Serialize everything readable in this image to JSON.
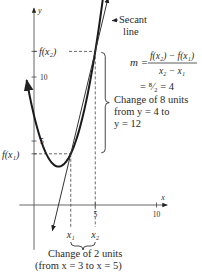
{
  "chart_data": {
    "type": "line",
    "title": "",
    "xlabel": "x",
    "ylabel": "y",
    "xlim": [
      -1.2,
      11.2
    ],
    "ylim": [
      -3.5,
      16.5
    ],
    "x_ticks": [
      {
        "value": 5,
        "label": "5"
      },
      {
        "value": 10,
        "label": "10"
      }
    ],
    "y_ticks": [
      {
        "value": 5,
        "label": "5"
      },
      {
        "value": 10,
        "label": "10"
      }
    ],
    "grid": false,
    "series": [
      {
        "name": "f(x)",
        "kind": "parabola",
        "formula": "x^2 - 4x + 7",
        "a": 1,
        "b": -4,
        "c": 7,
        "x_range": [
          -0.6,
          6.1
        ]
      },
      {
        "name": "Secant line",
        "kind": "line",
        "slope": 4,
        "through": [
          3,
          4
        ],
        "x_range": [
          1.5,
          6.05
        ]
      }
    ],
    "points": [
      {
        "name": "x1",
        "x": 3,
        "y": 4,
        "x_label": "x₁",
        "y_label": "f(x₁)"
      },
      {
        "name": "x2",
        "x": 5,
        "y": 12,
        "x_label": "x₂",
        "y_label": "f(x₂)"
      }
    ],
    "annotations": {
      "secant_label": [
        "Secant",
        "line"
      ],
      "slope_formula": {
        "lhs": "m =",
        "numerator": "f(x₂) − f(x₁)",
        "denominator": "x₂ − x₁"
      },
      "slope_value": "= ⁸⁄₂ = 4",
      "vertical_change": [
        "Change of 8 units",
        "from y = 4 to",
        "y = 12"
      ],
      "horizontal_change": [
        "Change of 2 units",
        "(from x = 3 to x = 5)"
      ]
    }
  }
}
